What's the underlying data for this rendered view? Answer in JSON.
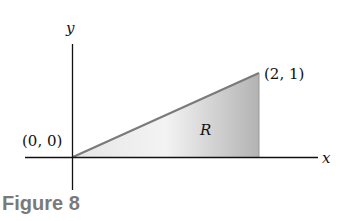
{
  "figure": {
    "caption": "Figure 8",
    "axes": {
      "x_label": "x",
      "y_label": "y"
    },
    "points": {
      "origin": "(0, 0)",
      "apex": "(2, 1)"
    },
    "region_label": "R",
    "colors": {
      "fill_light": "#f2f2f2",
      "fill_dark": "#b5b5b5",
      "edge": "#7a7a7a",
      "axis": "#111111",
      "caption": "#7a7a7a"
    }
  }
}
